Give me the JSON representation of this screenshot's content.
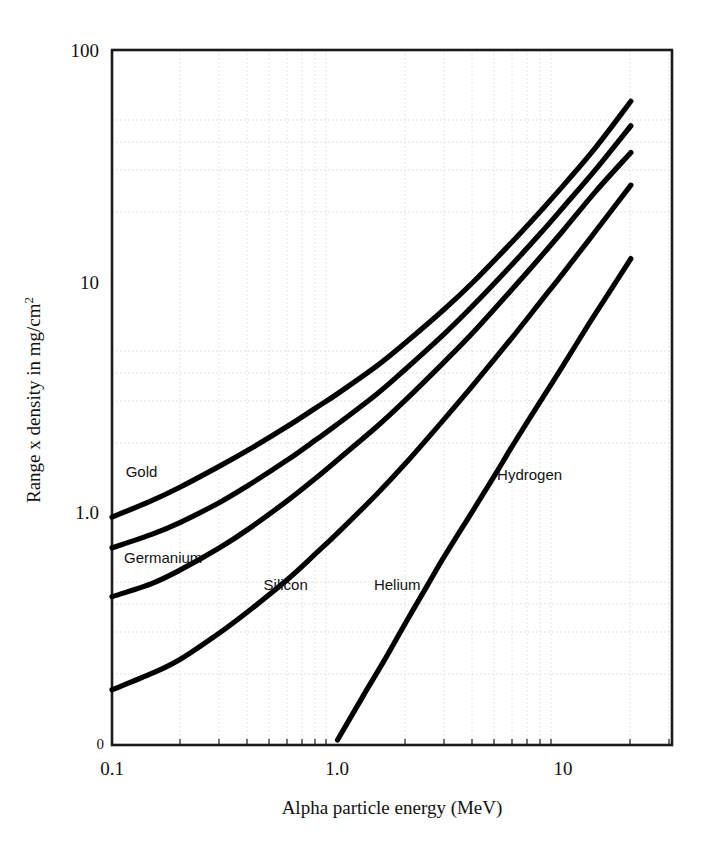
{
  "chart_data": {
    "type": "line",
    "title": "",
    "xlabel": "Alpha particle energy (MeV)",
    "ylabel": "Range x density in mg/cm",
    "ylabel_superscript": "2",
    "xscale": "log",
    "yscale": "log",
    "xlim": [
      0.1,
      21.5
    ],
    "ylim": [
      0.1,
      100
    ],
    "xticks": [
      "0.1",
      "1.0",
      "10"
    ],
    "xtick_values": [
      0.1,
      1.0,
      10
    ],
    "yticks": [
      "100",
      "10",
      "1.0",
      "0"
    ],
    "ytick_values": [
      100,
      10,
      1.0,
      0
    ],
    "grid": true,
    "grid_style": "dotted-minor",
    "legend_position": "inline-labels",
    "line_color": "#000000",
    "axis_color": "#1a1a1a",
    "grid_color": "#d8d8d8",
    "series": [
      {
        "name": "Gold",
        "label": "Gold",
        "label_x": 0.115,
        "label_y": 1.42,
        "x": [
          0.1,
          0.15,
          0.2,
          0.3,
          0.4,
          0.6,
          0.8,
          1.0,
          1.5,
          2.0,
          3.0,
          4.0,
          6.0,
          8.0,
          10.0,
          14.0,
          20.0
        ],
        "y": [
          0.95,
          1.12,
          1.28,
          1.58,
          1.85,
          2.35,
          2.82,
          3.25,
          4.3,
          5.4,
          7.6,
          9.9,
          14.9,
          20.2,
          25.8,
          38.0,
          60.0
        ]
      },
      {
        "name": "Germanium",
        "label": "Germanium",
        "label_x": 0.113,
        "label_y": 0.6,
        "x": [
          0.1,
          0.15,
          0.2,
          0.3,
          0.4,
          0.6,
          0.8,
          1.0,
          1.5,
          2.0,
          3.0,
          4.0,
          6.0,
          8.0,
          10.0,
          14.0,
          20.0
        ],
        "y": [
          0.7,
          0.8,
          0.9,
          1.1,
          1.3,
          1.68,
          2.05,
          2.4,
          3.25,
          4.15,
          5.95,
          7.85,
          11.9,
          16.2,
          20.8,
          30.5,
          47.0
        ]
      },
      {
        "name": "Silicon",
        "label": "Silicon",
        "label_x": 0.47,
        "label_y": 0.46,
        "x": [
          0.1,
          0.15,
          0.2,
          0.3,
          0.4,
          0.6,
          0.8,
          1.0,
          1.5,
          2.0,
          3.0,
          4.0,
          6.0,
          8.0,
          10.0,
          14.0,
          20.0
        ],
        "y": [
          0.43,
          0.49,
          0.56,
          0.7,
          0.84,
          1.12,
          1.4,
          1.68,
          2.35,
          3.05,
          4.5,
          6.0,
          9.3,
          12.8,
          16.5,
          24.5,
          36.0
        ]
      },
      {
        "name": "Helium",
        "label": "Helium",
        "label_x": 1.45,
        "label_y": 0.46,
        "x": [
          0.1,
          0.15,
          0.2,
          0.3,
          0.4,
          0.6,
          0.8,
          1.0,
          1.5,
          2.0,
          3.0,
          4.0,
          6.0,
          8.0,
          10.0,
          14.0,
          20.0
        ],
        "y": [
          0.17,
          0.2,
          0.23,
          0.3,
          0.37,
          0.51,
          0.66,
          0.81,
          1.2,
          1.62,
          2.55,
          3.55,
          5.75,
          8.2,
          10.8,
          16.5,
          26.0
        ]
      },
      {
        "name": "Hydrogen",
        "label": "Hydrogen",
        "label_x": 5.1,
        "label_y": 1.38,
        "x": [
          1.0,
          1.3,
          1.6,
          2.0,
          2.5,
          3.0,
          4.0,
          5.0,
          6.0,
          8.0,
          10.0,
          13.0,
          16.0,
          20.0
        ],
        "y": [
          0.103,
          0.16,
          0.225,
          0.33,
          0.48,
          0.65,
          1.02,
          1.45,
          1.95,
          3.05,
          4.3,
          6.5,
          8.9,
          12.5
        ]
      }
    ]
  },
  "axes": {
    "y_axis_title_main": "Range x density in mg/cm",
    "y_axis_title_sup": "2",
    "x_axis_title": "Alpha particle energy (MeV)",
    "y_tick_100": "100",
    "y_tick_10": "10",
    "y_tick_1": "1.0",
    "y_tick_0": "0",
    "x_tick_01": "0.1",
    "x_tick_10": "1.0",
    "x_tick_100": "10"
  }
}
